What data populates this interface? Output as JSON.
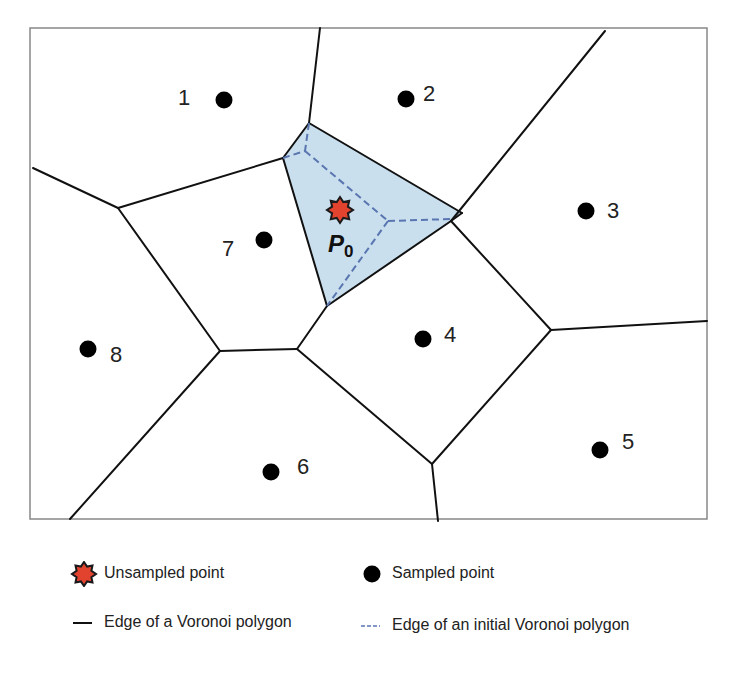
{
  "diagram": {
    "frame": {
      "x": 30,
      "y": 28,
      "width": 677,
      "height": 491,
      "stroke": "#888888"
    },
    "colors": {
      "edge": "#111111",
      "initial_edge": "#5a76b0",
      "highlight_fill": "#c9dfee",
      "unsampled_fill": "#e2432f",
      "unsampled_stroke": "#1a1a1a",
      "sampled_fill": "#000000",
      "label": "#222222"
    },
    "sampled_points": [
      {
        "id": "1",
        "label": "1",
        "x": 224,
        "y": 100,
        "lx": 178,
        "ly": 99
      },
      {
        "id": "2",
        "label": "2",
        "x": 406,
        "y": 99,
        "lx": 423,
        "ly": 95
      },
      {
        "id": "3",
        "label": "3",
        "x": 586,
        "y": 211,
        "lx": 607,
        "ly": 212
      },
      {
        "id": "4",
        "label": "4",
        "x": 423,
        "y": 339,
        "lx": 444,
        "ly": 336
      },
      {
        "id": "5",
        "label": "5",
        "x": 600,
        "y": 450,
        "lx": 622,
        "ly": 443
      },
      {
        "id": "6",
        "label": "6",
        "x": 271,
        "y": 472,
        "lx": 297,
        "ly": 468
      },
      {
        "id": "7",
        "label": "7",
        "x": 264,
        "y": 240,
        "lx": 222,
        "ly": 250
      },
      {
        "id": "8",
        "label": "8",
        "x": 88,
        "y": 349,
        "lx": 110,
        "ly": 356
      }
    ],
    "unsampled_point": {
      "label": "P",
      "subscript": "0",
      "x": 340,
      "y": 210,
      "lx": 328,
      "ly": 252
    },
    "highlight_polygon": [
      [
        309,
        123
      ],
      [
        283,
        158
      ],
      [
        327,
        306
      ],
      [
        451,
        221
      ],
      [
        462,
        213
      ]
    ],
    "voronoi_edges": [
      [
        [
          320,
          28
        ],
        [
          309,
          123
        ]
      ],
      [
        [
          309,
          123
        ],
        [
          283,
          158
        ]
      ],
      [
        [
          283,
          158
        ],
        [
          118,
          208
        ]
      ],
      [
        [
          118,
          208
        ],
        [
          33,
          168
        ]
      ],
      [
        [
          118,
          208
        ],
        [
          220,
          351
        ]
      ],
      [
        [
          283,
          158
        ],
        [
          327,
          306
        ]
      ],
      [
        [
          309,
          123
        ],
        [
          462,
          213
        ]
      ],
      [
        [
          462,
          213
        ],
        [
          451,
          221
        ]
      ],
      [
        [
          451,
          221
        ],
        [
          327,
          306
        ]
      ],
      [
        [
          327,
          306
        ],
        [
          297,
          349
        ]
      ],
      [
        [
          297,
          349
        ],
        [
          220,
          351
        ]
      ],
      [
        [
          220,
          351
        ],
        [
          70,
          519
        ]
      ],
      [
        [
          297,
          349
        ],
        [
          432,
          464
        ]
      ],
      [
        [
          432,
          464
        ],
        [
          438,
          521
        ]
      ],
      [
        [
          432,
          464
        ],
        [
          551,
          330
        ]
      ],
      [
        [
          451,
          221
        ],
        [
          551,
          330
        ]
      ],
      [
        [
          551,
          330
        ],
        [
          707,
          321
        ]
      ],
      [
        [
          605,
          31
        ],
        [
          451,
          221
        ]
      ]
    ],
    "initial_edges": [
      [
        [
          309,
          123
        ],
        [
          305,
          151
        ]
      ],
      [
        [
          283,
          158
        ],
        [
          305,
          151
        ]
      ],
      [
        [
          305,
          151
        ],
        [
          388,
          221
        ]
      ],
      [
        [
          388,
          221
        ],
        [
          451,
          219
        ]
      ],
      [
        [
          388,
          221
        ],
        [
          327,
          306
        ]
      ]
    ]
  },
  "legend": {
    "items": [
      {
        "key": "unsampled",
        "label": "Unsampled point",
        "x": 70,
        "y": 561
      },
      {
        "key": "sampled",
        "label": "Sampled point",
        "x": 358,
        "y": 561
      },
      {
        "key": "edge",
        "label": "Edge of a Voronoi polygon",
        "x": 70,
        "y": 610
      },
      {
        "key": "initial_edge",
        "label": "Edge of an initial Voronoi polygon",
        "x": 358,
        "y": 613
      }
    ]
  }
}
